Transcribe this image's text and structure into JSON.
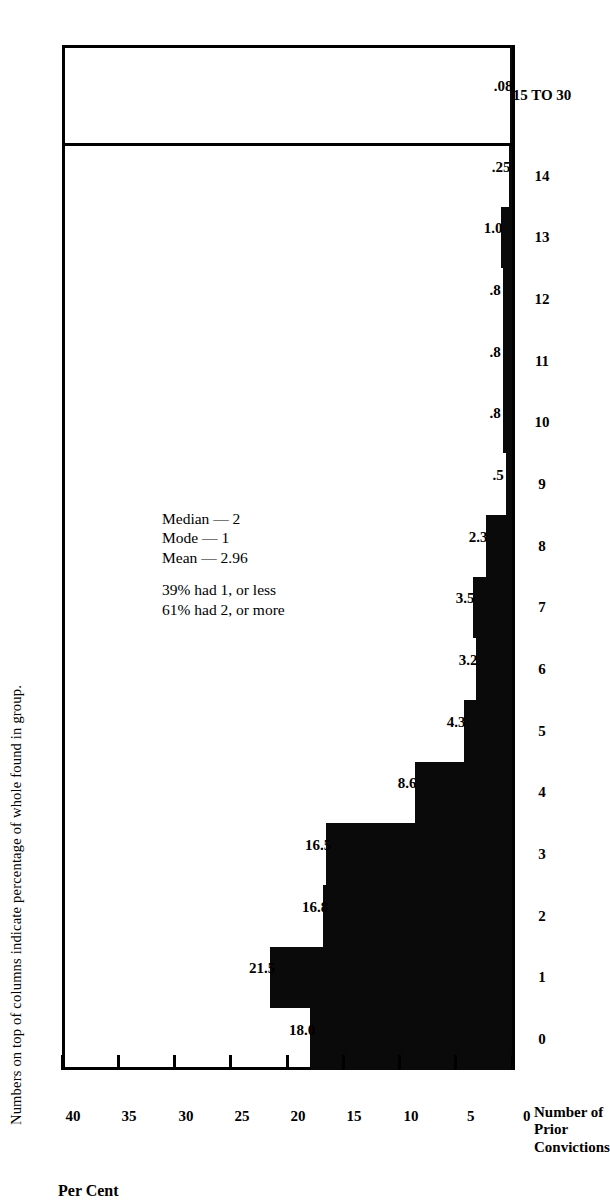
{
  "figure": {
    "caption": "Numbers on top of columns indicate percentage of whole found in group.",
    "yaxis_title": "Per Cent",
    "xaxis_title_lines": [
      "Number of",
      "Prior",
      "Convictions"
    ],
    "ink_color": "#000000",
    "paper_color": "#ffffff"
  },
  "annotations": {
    "stats": [
      "Median — 2",
      "Mode — 1",
      "Mean — 2.96"
    ],
    "splits": [
      "39% had 1, or less",
      "61% had 2, or more"
    ]
  },
  "chart_data": {
    "type": "bar",
    "title": "",
    "subtitle": "Numbers on top of columns indicate percentage of whole found in group.",
    "xlabel": "Number of Prior Convictions",
    "ylabel": "Per Cent",
    "ylim": [
      0,
      40
    ],
    "yticks": [
      0,
      5,
      10,
      15,
      20,
      25,
      30,
      35,
      40
    ],
    "grid": false,
    "legend": null,
    "categories": [
      "0",
      "1",
      "2",
      "3",
      "4",
      "5",
      "6",
      "7",
      "8",
      "9",
      "10",
      "11",
      "12",
      "13",
      "14",
      "15 TO 30"
    ],
    "values": [
      18.0,
      21.5,
      16.8,
      16.5,
      8.6,
      4.3,
      3.2,
      3.5,
      2.3,
      0.5,
      0.8,
      0.8,
      0.8,
      1.0,
      0.25,
      0.08
    ],
    "labels": [
      "18.0",
      "21.5",
      "16.8",
      "16.5",
      "8.6",
      "4.3",
      "3.2",
      "3.5",
      "2.3",
      ".5",
      ".8",
      ".8",
      ".8",
      "1.0",
      ".25",
      ".08"
    ],
    "annotations": [
      "Median — 2",
      "Mode — 1",
      "Mean — 2.96",
      "39% had 1, or less",
      "61% had 2, or more"
    ]
  }
}
